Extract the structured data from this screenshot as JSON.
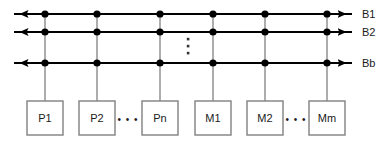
{
  "diagram": {
    "type": "bus-architecture-block-diagram",
    "canvas": {
      "width": 392,
      "height": 141,
      "background": "#ffffff"
    },
    "colors": {
      "bus_line": "#000000",
      "node_box_border": "#808080",
      "node_box_fill": "#ffffff",
      "connector_line": "#999999",
      "text": "#1a1a1a",
      "ellipsis_dot": "#333333"
    },
    "buses": [
      {
        "id": "bus-b1",
        "label": "B1",
        "y": 14,
        "x_start": 14,
        "x_end": 352,
        "arrow": "double"
      },
      {
        "id": "bus-b2",
        "label": "B2",
        "y": 32,
        "x_start": 14,
        "x_end": 352,
        "arrow": "double"
      },
      {
        "id": "bus-bb",
        "label": "Bb",
        "y": 63,
        "x_start": 14,
        "x_end": 352,
        "arrow": "double"
      }
    ],
    "bus_vertical_ellipsis": {
      "label": "vertical-ellipsis",
      "x": 188,
      "dots_y": [
        39,
        46,
        53
      ],
      "dot_size": 2.5
    },
    "junction_columns": [
      45,
      97,
      160,
      213,
      265,
      327
    ],
    "nodes": [
      {
        "id": "node-p1",
        "label": "P1",
        "cx": 45,
        "group": "processor"
      },
      {
        "id": "node-p2",
        "label": "P2",
        "cx": 97,
        "group": "processor"
      },
      {
        "id": "node-pn",
        "label": "Pn",
        "cx": 160,
        "group": "processor"
      },
      {
        "id": "node-m1",
        "label": "M1",
        "cx": 213,
        "group": "memory"
      },
      {
        "id": "node-m2",
        "label": "M2",
        "cx": 265,
        "group": "memory"
      },
      {
        "id": "node-mm",
        "label": "Mm",
        "cx": 327,
        "group": "memory"
      }
    ],
    "node_box": {
      "width": 36,
      "height": 34,
      "top": 101
    },
    "horizontal_ellipses": [
      {
        "id": "hdots-processors",
        "text": "• • •",
        "cx": 128,
        "cy": 120
      },
      {
        "id": "hdots-memories",
        "text": "• • •",
        "cx": 296,
        "cy": 120
      }
    ],
    "labels": {
      "b1": "B1",
      "b2": "B2",
      "bb": "Bb",
      "p1": "P1",
      "p2": "P2",
      "pn": "Pn",
      "m1": "M1",
      "m2": "M2",
      "mm": "Mm",
      "hdots": "• • •"
    }
  }
}
